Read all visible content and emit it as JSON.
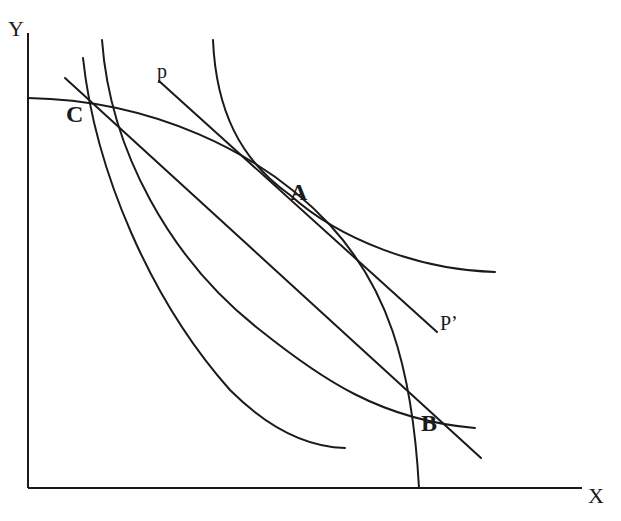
{
  "diagram": {
    "type": "economics-ppf-indifference",
    "axes": {
      "x_label": "X",
      "y_label": "Y"
    },
    "points": {
      "A": "A",
      "B": "B",
      "C": "C"
    },
    "price_line": {
      "start_label": "p",
      "end_label": "P’"
    },
    "colors": {
      "stroke": "#1a1a1a",
      "background": "#ffffff"
    }
  }
}
